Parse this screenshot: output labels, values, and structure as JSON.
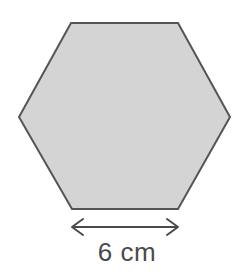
{
  "figure": {
    "name": "hexagon-with-side-length-label",
    "background_color": "#ffffff",
    "shape": {
      "name": "regular-hexagon",
      "fill_color": "#d4d4d4",
      "stroke_color": "#555555",
      "stroke_width": 2,
      "orientation": "flat-top",
      "vertices": [
        [
          71,
          23
        ],
        [
          178,
          23
        ],
        [
          230,
          117
        ],
        [
          178,
          209
        ],
        [
          72,
          209
        ],
        [
          19,
          117
        ]
      ],
      "points_attr": "71,23 178,23 230,117 178,209 72,209 19,117"
    },
    "dimension": {
      "name": "bottom-side-dimension",
      "label": "6 cm",
      "value": 6,
      "unit": "cm",
      "measures": "bottom-side-length",
      "line_color": "#4a4a4a",
      "line_width": 2,
      "line_y": 227,
      "line_x1": 72,
      "line_x2": 178,
      "arrowheads": "both-ends-open-v",
      "label_color": "#4a4a4a",
      "label_x": 127,
      "label_y": 261
    }
  }
}
